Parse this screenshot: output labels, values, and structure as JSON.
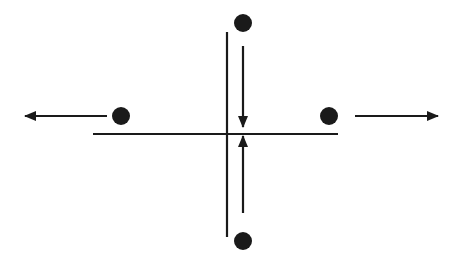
{
  "diagram": {
    "colors": {
      "background": "#ffffff",
      "stroke": "#1a1a1a",
      "dot": "#1a1a1a"
    },
    "lines": {
      "vertical": {
        "x": 227,
        "y1": 32,
        "y2": 237
      },
      "horizontal": {
        "y": 134,
        "x1": 93,
        "x2": 338
      }
    },
    "dots": [
      {
        "id": "top",
        "cx": 243,
        "cy": 23,
        "r": 9
      },
      {
        "id": "bottom",
        "cx": 243,
        "cy": 241,
        "r": 9
      },
      {
        "id": "left",
        "cx": 121,
        "cy": 116,
        "r": 9
      },
      {
        "id": "right",
        "cx": 329,
        "cy": 116,
        "r": 9
      }
    ],
    "arrows": [
      {
        "id": "top-down",
        "direction": "down",
        "x1": 243,
        "y1": 46,
        "x2": 243,
        "y2": 127
      },
      {
        "id": "bottom-up",
        "direction": "up",
        "x1": 243,
        "y1": 213,
        "x2": 243,
        "y2": 136
      },
      {
        "id": "left-out",
        "direction": "left",
        "x1": 107,
        "y1": 116,
        "x2": 25,
        "y2": 116
      },
      {
        "id": "right-out",
        "direction": "right",
        "x1": 355,
        "y1": 116,
        "x2": 438,
        "y2": 116
      }
    ]
  }
}
